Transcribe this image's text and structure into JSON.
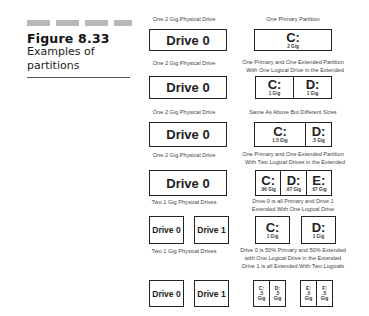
{
  "figure": {
    "number": "Figure 8.33",
    "caption": "Examples of partitions"
  },
  "rows": [
    {
      "left_label": "One 2 Gig Physical Drive",
      "right_label": [
        "One Primary Partition"
      ],
      "drives": [
        "Drive 0"
      ],
      "partitions": [
        [
          {
            "letter": "C:",
            "size": "2 Gig"
          }
        ]
      ]
    },
    {
      "left_label": "One 2 Gig Physical Drive",
      "right_label": [
        "One Primary and One Extended Partition",
        "With One Logical Drive in the Extended"
      ],
      "drives": [
        "Drive 0"
      ],
      "partitions": [
        [
          {
            "letter": "C:",
            "size": "1 Gig"
          },
          {
            "letter": "D:",
            "size": "1 Gig"
          }
        ]
      ]
    },
    {
      "left_label": "One 2 Gig Physical Drive",
      "right_label": [
        "Same As Above But Different Sizes"
      ],
      "drives": [
        "Drive 0"
      ],
      "partitions": [
        [
          {
            "letter": "C:",
            "size": "1.5 Gig"
          },
          {
            "letter": "D:",
            "size": ".5 Gig"
          }
        ]
      ]
    },
    {
      "left_label": "One 2 Gig Physical Drive",
      "right_label": [
        "One Primary and One Extended Partition",
        "With Two Logical Drives in the Extended"
      ],
      "drives": [
        "Drive 0"
      ],
      "partitions": [
        [
          {
            "letter": "C:",
            "size": ".66 Gig"
          },
          {
            "letter": "D:",
            "size": ".67 Gig"
          },
          {
            "letter": "E:",
            "size": ".67 Gig"
          }
        ]
      ]
    },
    {
      "left_label": "Two 1 Gig Physical Drives",
      "right_label": [
        "Drive 0 is all Primary and Drive 1",
        "Extended With One Logical Drive"
      ],
      "drives": [
        "Drive 0",
        "Drive 1"
      ],
      "partitions": [
        [
          {
            "letter": "C:",
            "size": "1 Gig"
          }
        ],
        [
          {
            "letter": "D:",
            "size": "1 Gig"
          }
        ]
      ]
    },
    {
      "left_label": "Two 1 Gig Physical Drives",
      "right_label": [
        "Drive 0 is 50% Primary and 50% Extended",
        "with One Logical Drive in the Extended",
        "Drive 1 is all Extended With Two Logicals"
      ],
      "drives": [
        "Drive 0",
        "Drive 1"
      ],
      "partitions": [
        [
          {
            "letter": "C:",
            "size": ".5",
            "unit": "Gig"
          },
          {
            "letter": "D:",
            "size": ".5",
            "unit": "Gig"
          }
        ],
        [
          {
            "letter": "E:",
            "size": ".5",
            "unit": "Gig"
          },
          {
            "letter": "F:",
            "size": ".5",
            "unit": "Gig"
          }
        ]
      ]
    }
  ]
}
